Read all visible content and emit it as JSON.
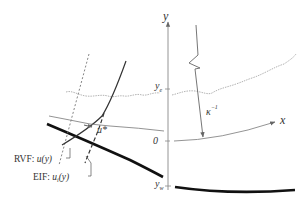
{
  "labels": {
    "y_axis": "y",
    "x_axis": "x",
    "origin": "0",
    "y_e": "y",
    "y_e_sub": "e",
    "y_w": "y",
    "y_w_sub": "w",
    "kappa": "κ",
    "kappa_sup": "−1",
    "u_star": "u*",
    "rvf_prefix": "RVF: ",
    "rvf_func": "u(y)",
    "eif_prefix": "EIF: ",
    "eif_func": "u",
    "eif_sub": "i",
    "eif_arg": "(y)"
  },
  "colors": {
    "axis": "#888888",
    "wall": "#111111",
    "profile": "#333333",
    "edge": "#aaaaaa"
  }
}
